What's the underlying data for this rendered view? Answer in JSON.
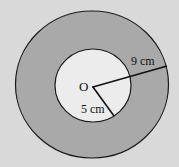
{
  "diagram": {
    "center_label": "O",
    "outer_radius_label": "9 cm",
    "inner_radius_label": "5 cm",
    "outer_radius_value_cm": 9,
    "inner_radius_value_cm": 5,
    "colors": {
      "background": "#d9d9d9",
      "ring_fill": "#a9a9a9",
      "inner_fill": "#ececec",
      "stroke": "#1a1a1a"
    }
  }
}
